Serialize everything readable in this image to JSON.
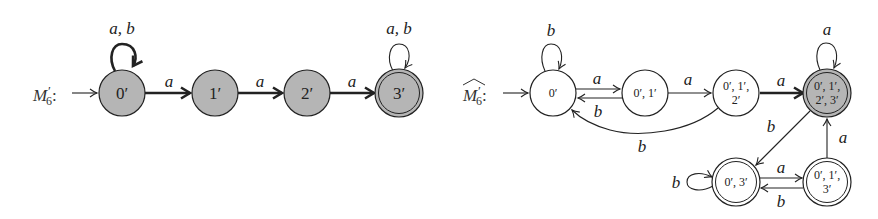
{
  "colors": {
    "stroke": "#222222",
    "filled_state": "#b5b5b5",
    "background": "#ffffff"
  },
  "left_machine": {
    "label_base": "M",
    "label_prime": "′",
    "label_sub": "6",
    "label_colon": ":",
    "states": [
      {
        "id": "0'",
        "label": "0′",
        "filled": true,
        "accepting": false,
        "initial": true
      },
      {
        "id": "1'",
        "label": "1′",
        "filled": true,
        "accepting": false,
        "initial": false
      },
      {
        "id": "2'",
        "label": "2′",
        "filled": true,
        "accepting": false,
        "initial": false
      },
      {
        "id": "3'",
        "label": "3′",
        "filled": true,
        "accepting": true,
        "initial": false
      }
    ],
    "transitions": [
      {
        "from": "0'",
        "to": "0'",
        "label": "a, b",
        "bold": true
      },
      {
        "from": "0'",
        "to": "1'",
        "label": "a",
        "bold": true
      },
      {
        "from": "1'",
        "to": "2'",
        "label": "a",
        "bold": true
      },
      {
        "from": "2'",
        "to": "3'",
        "label": "a",
        "bold": true
      },
      {
        "from": "3'",
        "to": "3'",
        "label": "a, b",
        "bold": false
      }
    ]
  },
  "right_machine": {
    "label_base": "M",
    "label_prime": "′",
    "label_sub": "6",
    "label_colon": ":",
    "hat": true,
    "states": [
      {
        "id": "{0'}",
        "label_lines": [
          "0′"
        ],
        "filled": false,
        "accepting": false,
        "initial": true
      },
      {
        "id": "{0',1'}",
        "label_lines": [
          "0′, 1′"
        ],
        "filled": false,
        "accepting": false,
        "initial": false
      },
      {
        "id": "{0',1',2'}",
        "label_lines": [
          "0′, 1′,",
          "2′"
        ],
        "filled": false,
        "accepting": false,
        "initial": false
      },
      {
        "id": "{0',1',2',3'}",
        "label_lines": [
          "0′, 1′,",
          "2′, 3′"
        ],
        "filled": true,
        "accepting": true,
        "initial": false
      },
      {
        "id": "{0',3'}",
        "label_lines": [
          "0′, 3′"
        ],
        "filled": false,
        "accepting": true,
        "initial": false
      },
      {
        "id": "{0',1',3'}",
        "label_lines": [
          "0′, 1′,",
          "3′"
        ],
        "filled": false,
        "accepting": true,
        "initial": false
      }
    ],
    "transitions": [
      {
        "from": "{0'}",
        "to": "{0'}",
        "label": "b",
        "bold": false
      },
      {
        "from": "{0'}",
        "to": "{0',1'}",
        "label": "a",
        "bold": false
      },
      {
        "from": "{0',1'}",
        "to": "{0'}",
        "label": "b",
        "bold": false
      },
      {
        "from": "{0',1'}",
        "to": "{0',1',2'}",
        "label": "a",
        "bold": false
      },
      {
        "from": "{0',1',2'}",
        "to": "{0'}",
        "label": "b",
        "bold": false
      },
      {
        "from": "{0',1',2'}",
        "to": "{0',1',2',3'}",
        "label": "a",
        "bold": true
      },
      {
        "from": "{0',1',2',3'}",
        "to": "{0',1',2',3'}",
        "label": "a",
        "bold": false
      },
      {
        "from": "{0',1',2',3'}",
        "to": "{0',3'}",
        "label": "b",
        "bold": false
      },
      {
        "from": "{0',3'}",
        "to": "{0',3'}",
        "label": "b",
        "bold": false
      },
      {
        "from": "{0',3'}",
        "to": "{0',1',3'}",
        "label": "a",
        "bold": false
      },
      {
        "from": "{0',1',3'}",
        "to": "{0',3'}",
        "label": "b",
        "bold": false
      },
      {
        "from": "{0',1',3'}",
        "to": "{0',1',2',3'}",
        "label": "a",
        "bold": false
      }
    ]
  }
}
